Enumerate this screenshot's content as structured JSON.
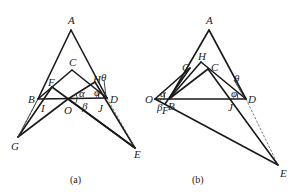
{
  "figure_a": {
    "caption": "(a)",
    "labels": {
      "A": "A",
      "B": "B",
      "C": "C",
      "D": "D",
      "E": "E",
      "F": "F",
      "G": "G",
      "H": "H",
      "I": "I",
      "J": "J",
      "O": "O",
      "alpha": "α",
      "beta": "β",
      "theta": "θ",
      "phi": "φ"
    }
  },
  "figure_b": {
    "caption": "(b)",
    "labels": {
      "A": "A",
      "B": "B",
      "C": "C",
      "D": "D",
      "E": "E",
      "F": "F",
      "G": "G",
      "H": "H",
      "J": "J",
      "O": "O",
      "alpha": "α",
      "beta": "β",
      "theta": "θ",
      "phi": "φ"
    }
  }
}
